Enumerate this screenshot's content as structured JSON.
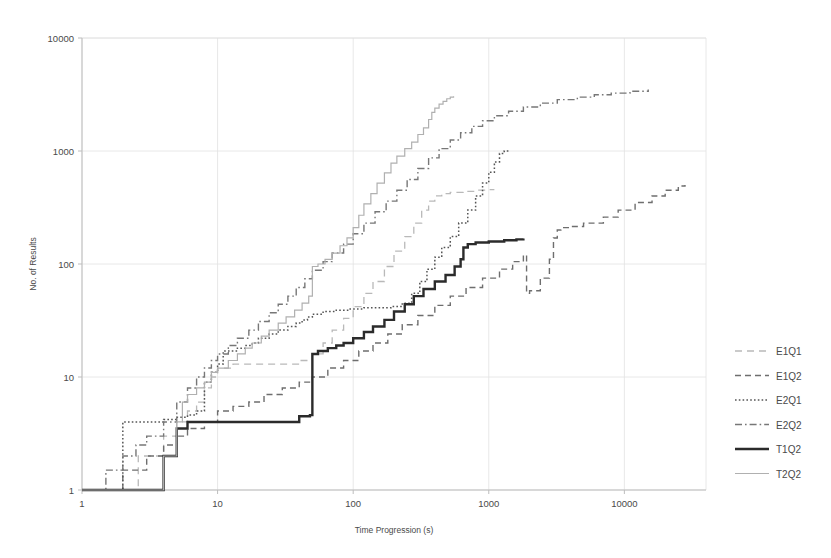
{
  "chart_data": {
    "type": "line",
    "title": "",
    "xlabel": "Time Progression (s)",
    "ylabel": "No. of Results",
    "xscale": "log",
    "yscale": "log",
    "xlim": [
      1,
      40000
    ],
    "ylim": [
      1,
      10000
    ],
    "xticks": [
      1,
      10,
      100,
      1000,
      10000
    ],
    "xtick_labels": [
      "1",
      "10",
      "100",
      "1000",
      "10000"
    ],
    "yticks": [
      1,
      10,
      100,
      1000,
      10000
    ],
    "ytick_labels": [
      "1",
      "10",
      "100",
      "1000",
      "10000"
    ],
    "grid": true,
    "legend_position": "right",
    "series": [
      {
        "name": "E1Q1",
        "style": "longdash",
        "color": "#b9b9b9",
        "width": 1.3,
        "points": [
          [
            1,
            1
          ],
          [
            2,
            1
          ],
          [
            2.6,
            2
          ],
          [
            3.2,
            2
          ],
          [
            4,
            3
          ],
          [
            5,
            4
          ],
          [
            6,
            5
          ],
          [
            7,
            6
          ],
          [
            8,
            8
          ],
          [
            9,
            10
          ],
          [
            10,
            12
          ],
          [
            13,
            13
          ],
          [
            17,
            13
          ],
          [
            22,
            13
          ],
          [
            30,
            13
          ],
          [
            40,
            14
          ],
          [
            50,
            16
          ],
          [
            60,
            20
          ],
          [
            70,
            26
          ],
          [
            85,
            33
          ],
          [
            100,
            42
          ],
          [
            120,
            55
          ],
          [
            140,
            70
          ],
          [
            170,
            95
          ],
          [
            200,
            130
          ],
          [
            240,
            175
          ],
          [
            280,
            230
          ],
          [
            320,
            300
          ],
          [
            360,
            360
          ],
          [
            400,
            400
          ],
          [
            450,
            420
          ],
          [
            520,
            430
          ],
          [
            650,
            440
          ],
          [
            800,
            450
          ],
          [
            1000,
            455
          ],
          [
            1100,
            455
          ]
        ]
      },
      {
        "name": "E1Q2",
        "style": "dash",
        "color": "#6e6e6e",
        "width": 1.4,
        "points": [
          [
            1,
            1
          ],
          [
            2,
            1.5
          ],
          [
            3,
            2
          ],
          [
            4,
            2.5
          ],
          [
            5,
            3
          ],
          [
            6,
            3.5
          ],
          [
            8,
            4
          ],
          [
            10,
            5
          ],
          [
            13,
            5.5
          ],
          [
            17,
            6
          ],
          [
            22,
            7
          ],
          [
            30,
            8
          ],
          [
            40,
            9
          ],
          [
            50,
            10
          ],
          [
            65,
            12
          ],
          [
            85,
            14
          ],
          [
            110,
            17
          ],
          [
            140,
            20
          ],
          [
            180,
            24
          ],
          [
            230,
            29
          ],
          [
            300,
            35
          ],
          [
            400,
            43
          ],
          [
            520,
            52
          ],
          [
            680,
            62
          ],
          [
            900,
            75
          ],
          [
            1200,
            90
          ],
          [
            1500,
            105
          ],
          [
            1800,
            120
          ],
          [
            1900,
            55
          ],
          [
            2000,
            58
          ],
          [
            2400,
            75
          ],
          [
            2800,
            110
          ],
          [
            3000,
            170
          ],
          [
            3200,
            200
          ],
          [
            3400,
            210
          ],
          [
            4000,
            215
          ],
          [
            5000,
            230
          ],
          [
            7000,
            260
          ],
          [
            9000,
            300
          ],
          [
            12000,
            350
          ],
          [
            16000,
            400
          ],
          [
            20000,
            450
          ],
          [
            25000,
            490
          ],
          [
            28000,
            500
          ]
        ]
      },
      {
        "name": "E2Q1",
        "style": "dot",
        "color": "#555555",
        "width": 1.5,
        "points": [
          [
            1,
            1
          ],
          [
            2,
            1
          ],
          [
            2,
            4
          ],
          [
            3,
            4
          ],
          [
            4,
            4.2
          ],
          [
            5,
            4.4
          ],
          [
            6,
            4.6
          ],
          [
            7,
            5
          ],
          [
            8,
            9
          ],
          [
            9,
            11
          ],
          [
            10,
            13
          ],
          [
            11,
            17
          ],
          [
            12,
            17
          ],
          [
            14,
            18
          ],
          [
            16,
            19
          ],
          [
            18,
            20
          ],
          [
            20,
            22
          ],
          [
            24,
            24
          ],
          [
            28,
            26
          ],
          [
            33,
            28
          ],
          [
            38,
            30
          ],
          [
            42,
            32
          ],
          [
            46,
            34
          ],
          [
            50,
            36
          ],
          [
            60,
            38
          ],
          [
            75,
            39
          ],
          [
            95,
            40
          ],
          [
            120,
            41
          ],
          [
            150,
            41
          ],
          [
            190,
            42
          ],
          [
            230,
            45
          ],
          [
            270,
            55
          ],
          [
            310,
            70
          ],
          [
            350,
            90
          ],
          [
            400,
            115
          ],
          [
            450,
            140
          ],
          [
            520,
            175
          ],
          [
            600,
            230
          ],
          [
            700,
            300
          ],
          [
            800,
            400
          ],
          [
            900,
            520
          ],
          [
            1000,
            650
          ],
          [
            1100,
            800
          ],
          [
            1200,
            950
          ],
          [
            1300,
            1000
          ],
          [
            1400,
            1020
          ]
        ]
      },
      {
        "name": "E2Q2",
        "style": "dashdot",
        "color": "#777777",
        "width": 1.4,
        "points": [
          [
            1,
            1
          ],
          [
            1.5,
            1.5
          ],
          [
            2,
            2
          ],
          [
            2.5,
            2.5
          ],
          [
            3,
            3
          ],
          [
            4,
            4
          ],
          [
            5,
            6
          ],
          [
            6,
            8
          ],
          [
            7,
            10
          ],
          [
            8,
            12
          ],
          [
            9,
            14
          ],
          [
            10,
            16
          ],
          [
            12,
            19
          ],
          [
            14,
            22
          ],
          [
            17,
            26
          ],
          [
            20,
            31
          ],
          [
            24,
            37
          ],
          [
            28,
            44
          ],
          [
            33,
            52
          ],
          [
            38,
            62
          ],
          [
            44,
            74
          ],
          [
            50,
            88
          ],
          [
            60,
            105
          ],
          [
            70,
            125
          ],
          [
            85,
            150
          ],
          [
            100,
            185
          ],
          [
            120,
            230
          ],
          [
            145,
            290
          ],
          [
            175,
            360
          ],
          [
            210,
            450
          ],
          [
            250,
            560
          ],
          [
            300,
            700
          ],
          [
            360,
            870
          ],
          [
            430,
            1050
          ],
          [
            520,
            1250
          ],
          [
            620,
            1450
          ],
          [
            750,
            1650
          ],
          [
            900,
            1850
          ],
          [
            1100,
            2050
          ],
          [
            1400,
            2250
          ],
          [
            1800,
            2450
          ],
          [
            2400,
            2650
          ],
          [
            3200,
            2850
          ],
          [
            4500,
            3000
          ],
          [
            6000,
            3150
          ],
          [
            8000,
            3250
          ],
          [
            11000,
            3380
          ],
          [
            15000,
            3500
          ]
        ]
      },
      {
        "name": "T1Q2",
        "style": "solid",
        "color": "#2b2b2b",
        "width": 2.4,
        "points": [
          [
            1,
            1
          ],
          [
            3,
            1
          ],
          [
            4,
            2
          ],
          [
            5,
            3.5
          ],
          [
            6,
            4
          ],
          [
            10,
            4
          ],
          [
            20,
            4
          ],
          [
            30,
            4
          ],
          [
            40,
            4.5
          ],
          [
            48,
            4.6
          ],
          [
            50,
            16
          ],
          [
            55,
            17
          ],
          [
            65,
            18
          ],
          [
            75,
            19
          ],
          [
            85,
            20
          ],
          [
            100,
            22
          ],
          [
            120,
            25
          ],
          [
            140,
            28
          ],
          [
            170,
            32
          ],
          [
            200,
            38
          ],
          [
            240,
            44
          ],
          [
            280,
            52
          ],
          [
            330,
            60
          ],
          [
            400,
            70
          ],
          [
            480,
            80
          ],
          [
            560,
            95
          ],
          [
            620,
            110
          ],
          [
            650,
            140
          ],
          [
            700,
            150
          ],
          [
            800,
            155
          ],
          [
            1000,
            158
          ],
          [
            1300,
            162
          ],
          [
            1600,
            165
          ],
          [
            1800,
            168
          ]
        ]
      },
      {
        "name": "T2Q2",
        "style": "solid",
        "color": "#b0b0b0",
        "width": 1.2,
        "points": [
          [
            1,
            1
          ],
          [
            3,
            1
          ],
          [
            4,
            2
          ],
          [
            5,
            4
          ],
          [
            5.5,
            6
          ],
          [
            6,
            7
          ],
          [
            7,
            8
          ],
          [
            8,
            9
          ],
          [
            9,
            11
          ],
          [
            10,
            12
          ],
          [
            12,
            14
          ],
          [
            14,
            16
          ],
          [
            16,
            18
          ],
          [
            18,
            20
          ],
          [
            21,
            23
          ],
          [
            24,
            26
          ],
          [
            28,
            30
          ],
          [
            32,
            34
          ],
          [
            37,
            39
          ],
          [
            42,
            45
          ],
          [
            47,
            52
          ],
          [
            50,
            95
          ],
          [
            55,
            100
          ],
          [
            62,
            110
          ],
          [
            70,
            125
          ],
          [
            80,
            145
          ],
          [
            90,
            170
          ],
          [
            100,
            210
          ],
          [
            110,
            270
          ],
          [
            120,
            340
          ],
          [
            135,
            420
          ],
          [
            150,
            520
          ],
          [
            170,
            640
          ],
          [
            190,
            780
          ],
          [
            210,
            900
          ],
          [
            240,
            1050
          ],
          [
            270,
            1200
          ],
          [
            300,
            1400
          ],
          [
            330,
            1600
          ],
          [
            360,
            1900
          ],
          [
            380,
            2200
          ],
          [
            400,
            2400
          ],
          [
            430,
            2600
          ],
          [
            460,
            2750
          ],
          [
            490,
            2900
          ],
          [
            520,
            3000
          ],
          [
            550,
            3050
          ]
        ]
      }
    ]
  },
  "legend": {
    "items": [
      {
        "label": "E1Q1"
      },
      {
        "label": "E1Q2"
      },
      {
        "label": "E2Q1"
      },
      {
        "label": "E2Q2"
      },
      {
        "label": "T1Q2"
      },
      {
        "label": "T2Q2"
      }
    ]
  },
  "colors": {
    "background": "#ffffff",
    "grid": "#e2e2e2",
    "axis": "#bdbdbd",
    "text": "#4a4a4a"
  }
}
